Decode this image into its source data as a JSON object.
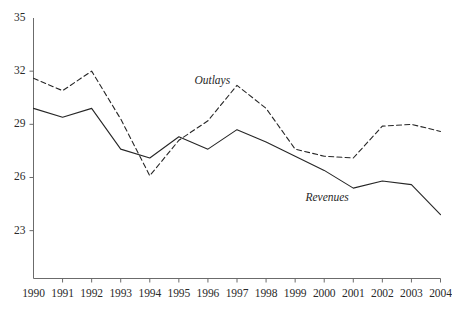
{
  "chart_data": {
    "type": "line",
    "title": "",
    "subtitle": "",
    "xlabel": "",
    "ylabel": "",
    "grid": false,
    "legend_position": "inline-annotation",
    "categories": [
      "1990",
      "1991",
      "1992",
      "1993",
      "1994",
      "1995",
      "1996",
      "1997",
      "1998",
      "1999",
      "2000",
      "2001",
      "2002",
      "2003",
      "2004"
    ],
    "x": [
      1990,
      1991,
      1992,
      1993,
      1994,
      1995,
      1996,
      1997,
      1998,
      1999,
      2000,
      2001,
      2002,
      2003,
      2004
    ],
    "xlim": [
      1990,
      2004
    ],
    "ylim": [
      20.3,
      35
    ],
    "y_ticks": [
      35,
      32,
      29,
      26,
      23
    ],
    "y_tick_labels": [
      "35",
      "32",
      "29",
      "26",
      "23"
    ],
    "x_ticks": [
      1990,
      1991,
      1992,
      1993,
      1994,
      1995,
      1996,
      1997,
      1998,
      1999,
      2000,
      2001,
      2002,
      2003,
      2004
    ],
    "x_tick_labels": [
      "1990",
      "1991",
      "1992",
      "1993",
      "1994",
      "1995",
      "1996",
      "1997",
      "1998",
      "1999",
      "2000",
      "2001",
      "2002",
      "2003",
      "2004"
    ],
    "series": [
      {
        "name": "Outlays",
        "label": "Outlays",
        "style": "dashed",
        "color": "#262626",
        "values": [
          31.6,
          30.9,
          32.0,
          29.3,
          26.1,
          28.1,
          29.2,
          31.2,
          29.9,
          27.6,
          27.2,
          27.1,
          28.9,
          29.0,
          28.6
        ]
      },
      {
        "name": "Revenues",
        "label": "Revenues",
        "style": "solid",
        "color": "#262626",
        "values": [
          29.9,
          29.4,
          29.9,
          27.6,
          27.1,
          28.3,
          27.6,
          28.7,
          28.0,
          27.2,
          26.4,
          25.4,
          25.8,
          25.6,
          23.9
        ]
      }
    ],
    "annotations": [
      {
        "text": "Outlays",
        "x": 1996.15,
        "y": 31.45,
        "series": "Outlays"
      },
      {
        "text": "Revenues",
        "x": 2000.1,
        "y": 24.85,
        "series": "Revenues"
      }
    ]
  },
  "colors": {
    "axis": "#6b6b6b",
    "line": "#262626",
    "text": "#2a2a2a",
    "background": "#ffffff"
  }
}
